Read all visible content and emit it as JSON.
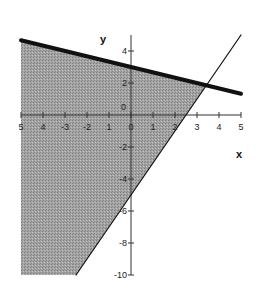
{
  "chart_data": {
    "type": "area",
    "title": "",
    "xlabel": "x",
    "ylabel": "y",
    "xlim": [
      -5,
      5
    ],
    "ylim": [
      -10,
      5
    ],
    "grid": false,
    "x_ticks": [
      -5,
      -4,
      -3,
      -2,
      -1,
      0,
      1,
      2,
      3,
      4,
      5
    ],
    "x_tick_labels": [
      "5",
      "4",
      "-3",
      "-2",
      "1",
      "0",
      "1",
      "2",
      "3",
      "4",
      "5"
    ],
    "y_ticks": [
      4,
      2,
      0,
      -2,
      -4,
      -6,
      -8,
      -10
    ],
    "y_tick_labels": [
      "4",
      "2",
      "0",
      "-2",
      "-4",
      "-6",
      "-8",
      "-10"
    ],
    "series": [
      {
        "name": "boundary-solid-thick",
        "equation": "y = -x/3 + 3",
        "style": "thick solid",
        "x": [
          -5,
          5
        ],
        "y": [
          4.67,
          1.33
        ]
      },
      {
        "name": "boundary-thin",
        "equation": "y = 2x - 5",
        "style": "thin solid",
        "x": [
          -2.5,
          5
        ],
        "y": [
          -10,
          5
        ]
      }
    ],
    "shaded_region": {
      "description": "y <= -x/3 + 3 and y >= 2x - 5",
      "vertices": [
        [
          -5,
          4.67
        ],
        [
          3.43,
          1.86
        ],
        [
          -2.5,
          -10
        ],
        [
          -5,
          -10
        ]
      ],
      "color": "#9a9a9a"
    },
    "intersection": [
      3.43,
      1.86
    ]
  },
  "colors": {
    "shade": "#9a9a9a",
    "line": "#111111",
    "axis": "#333333"
  }
}
